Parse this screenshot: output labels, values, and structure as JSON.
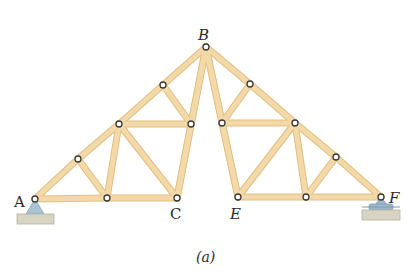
{
  "figure": {
    "caption": "(a)",
    "colors": {
      "member_fill": "#f3d9a8",
      "member_edge": "#e2bf83",
      "joint_stroke": "#3a3a3a",
      "joint_fill": "#ffffff",
      "support_fill": "#a9c3d6",
      "roller_fill": "#9fb7cc",
      "ground_fill": "#d8d4c4",
      "ground_edge": "#b8b29c",
      "label": "#2a2a2a"
    },
    "labels": {
      "A": "A",
      "B": "B",
      "C": "C",
      "E": "E",
      "F": "F"
    },
    "joints": {
      "A": [
        35,
        199
      ],
      "B": [
        206,
        47
      ],
      "C": [
        177,
        198
      ],
      "E": [
        238,
        197
      ],
      "F": [
        381,
        197
      ],
      "L1": [
        78,
        159
      ],
      "L2": [
        119,
        124
      ],
      "L3": [
        163,
        85
      ],
      "L4": [
        191,
        124
      ],
      "L5": [
        107,
        198
      ],
      "R1": [
        250,
        84
      ],
      "R2": [
        222,
        123
      ],
      "R3": [
        295,
        123
      ],
      "R4": [
        336,
        157
      ],
      "R5": [
        306,
        197
      ]
    },
    "members": [
      [
        "A",
        "L1"
      ],
      [
        "L1",
        "L2"
      ],
      [
        "L2",
        "L3"
      ],
      [
        "L3",
        "B"
      ],
      [
        "A",
        "L5"
      ],
      [
        "L5",
        "C"
      ],
      [
        "L1",
        "L5"
      ],
      [
        "L5",
        "L2"
      ],
      [
        "L2",
        "L4"
      ],
      [
        "L3",
        "L4"
      ],
      [
        "L2",
        "C"
      ],
      [
        "L4",
        "C"
      ],
      [
        "L4",
        "B"
      ],
      [
        "B",
        "R1"
      ],
      [
        "R1",
        "R3"
      ],
      [
        "R3",
        "R4"
      ],
      [
        "R4",
        "F"
      ],
      [
        "E",
        "R5"
      ],
      [
        "R5",
        "F"
      ],
      [
        "B",
        "R2"
      ],
      [
        "R2",
        "E"
      ],
      [
        "R1",
        "R2"
      ],
      [
        "R2",
        "R3"
      ],
      [
        "R3",
        "E"
      ],
      [
        "R3",
        "R5"
      ],
      [
        "R5",
        "R4"
      ],
      [
        "B",
        "C"
      ],
      [
        "B",
        "E"
      ]
    ]
  }
}
